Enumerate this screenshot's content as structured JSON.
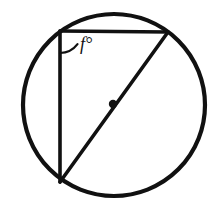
{
  "figure": {
    "kind": "geometry-diagram",
    "background_color": "#ffffff",
    "stroke_color": "#111111",
    "canvas": {
      "width": 224,
      "height": 216
    }
  },
  "circle": {
    "name": "circumscribed-circle",
    "center_x": 114,
    "center_y": 105,
    "radius": 91,
    "stroke_width": 4.2,
    "fill": "none",
    "stroke_color": "#111111"
  },
  "center_point": {
    "name": "circle-center-dot",
    "x": 113,
    "y": 104,
    "radius": 4.2,
    "fill": "#111111",
    "label": ""
  },
  "triangle": {
    "name": "inscribed-right-triangle",
    "stroke_width": 3.6,
    "stroke_color": "#111111",
    "fill": "none",
    "vertices": [
      {
        "name": "vertex-top-left",
        "x": 60,
        "y": 31
      },
      {
        "name": "vertex-top-right",
        "x": 168,
        "y": 32
      },
      {
        "name": "vertex-bottom-left",
        "x": 60,
        "y": 182
      }
    ],
    "sides": [
      {
        "name": "side-top-horizontal-chord",
        "from": "vertex-top-left",
        "to": "vertex-top-right"
      },
      {
        "name": "side-left-vertical-chord",
        "from": "vertex-top-left",
        "to": "vertex-bottom-left"
      },
      {
        "name": "side-diagonal-diameter",
        "from": "vertex-top-right",
        "to": "vertex-bottom-left",
        "is_diameter": true
      }
    ]
  },
  "angle_marker": {
    "name": "angle-arc-f",
    "at_vertex": "vertex-top-left",
    "arc_radius": 22,
    "stroke_width": 2.2,
    "stroke_color": "#111111",
    "arc_path": "M 60 53 A 22 22 0 0 0 76 45",
    "label": {
      "text": "f°",
      "value": "f",
      "unit": "°",
      "x": 80,
      "y": 50,
      "font_size": 18,
      "color": "#111111"
    }
  },
  "labels": {
    "angle_f": "f°"
  }
}
